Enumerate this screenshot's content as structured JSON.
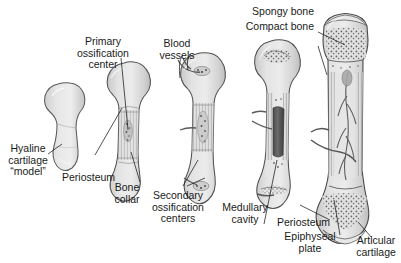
{
  "figure": {
    "background_color": "#ffffff",
    "text_color": "#1a1a1a",
    "bone_fill_color": "#dcdcdc",
    "bone_outline_color": "#4a4a4a",
    "marrow_color": "#5a5a5a",
    "vessel_color": "#555555"
  },
  "labels": [
    {
      "name": "primary-ossification-center",
      "text": "Primary\nossification\ncenter"
    },
    {
      "name": "blood-vessels",
      "text": "Blood\nvessels"
    },
    {
      "name": "spongy-bone",
      "text": "Spongy bone"
    },
    {
      "name": "compact-bone",
      "text": "Compact bone"
    },
    {
      "name": "hyaline-cartilage-model",
      "text": "Hyaline\ncartilage\n“model”"
    },
    {
      "name": "periosteum-left",
      "text": "Periosteum"
    },
    {
      "name": "bone-collar",
      "text": "Bone\ncollar"
    },
    {
      "name": "secondary-ossification-centers",
      "text": "Secondary\nossification\ncenters"
    },
    {
      "name": "medullary-cavity",
      "text": "Medullary\ncavity"
    },
    {
      "name": "periosteum-right",
      "text": "Periosteum"
    },
    {
      "name": "epiphyseal-plate",
      "text": "Epiphyseal\nplate"
    },
    {
      "name": "articular-cartilage",
      "text": "Articular\ncartilage"
    }
  ],
  "stages": [
    {
      "name": "stage-1-cartilage-model",
      "index": 1
    },
    {
      "name": "stage-2-bone-collar",
      "index": 2
    },
    {
      "name": "stage-3-vascular-invasion",
      "index": 3
    },
    {
      "name": "stage-4-medullary-cavity",
      "index": 4
    },
    {
      "name": "stage-5-mature-bone",
      "index": 5
    }
  ]
}
